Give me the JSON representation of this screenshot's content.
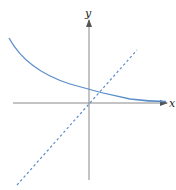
{
  "figure": {
    "axes": {
      "x_label": "x",
      "y_label": "y"
    },
    "colors": {
      "background": "#ffffff",
      "axis": "#888888",
      "curve": "#5b8ec9",
      "dashed_line": "#5b8ec9",
      "label": "#222222"
    },
    "curves": [
      {
        "name": "exponential-decay-curve",
        "style": "solid",
        "shape": "decreasing exponential approaching x-axis as asymptote"
      },
      {
        "name": "identity-line",
        "style": "dashed",
        "shape": "straight line through origin with positive slope"
      }
    ]
  }
}
